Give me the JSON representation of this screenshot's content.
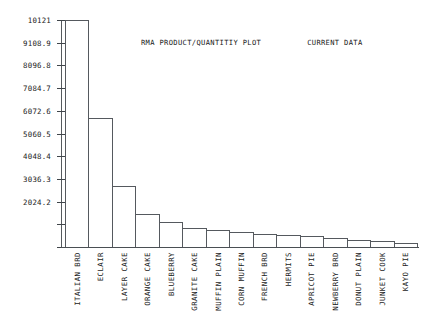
{
  "chart_data": {
    "type": "bar",
    "title": "RMA PRODUCT/QUANTITIY PLOT",
    "subtitle": "CURRENT DATA",
    "xlabel": "",
    "ylabel": "",
    "grid": false,
    "legend": "none",
    "ylim": [
      0,
      10121
    ],
    "ytick_labels": [
      "10121",
      "9108.9",
      "8096.8",
      "7084.7",
      "6072.6",
      "5060.5",
      "4048.4",
      "3036.3",
      "2024.2"
    ],
    "ytick_values": [
      10121,
      9108.9,
      8096.8,
      7084.7,
      6072.6,
      5060.5,
      4048.4,
      3036.3,
      2024.2
    ],
    "categories": [
      "ITALIAN BRD",
      "ECLAIR",
      "LAYER CAKE",
      "ORANGE CAKE",
      "BLUEBERRY",
      "GRANITE CAKE",
      "MUFFIN PLAIN",
      "CORN MUFFIN",
      "FRENCH BRD",
      "HERMITS",
      "APRICOT PIE",
      "NEWBERRY BRD",
      "DONUT PLAIN",
      "JUNKET COOK",
      "KAYO PIE"
    ],
    "values": [
      10121,
      5750,
      2720,
      1470,
      1115,
      850,
      760,
      690,
      600,
      535,
      470,
      400,
      335,
      270,
      180
    ]
  }
}
